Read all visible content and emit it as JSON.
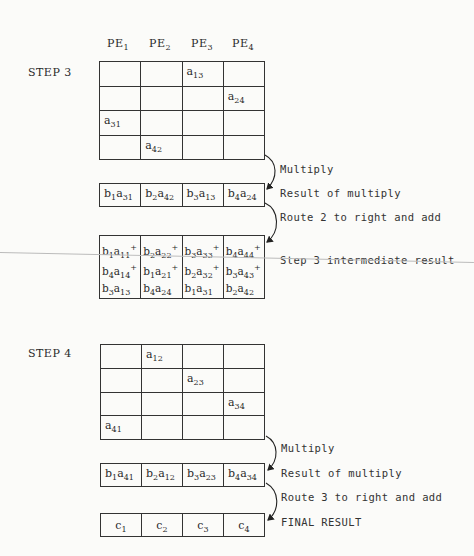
{
  "header": {
    "pe": [
      {
        "base": "PE",
        "sub": "1"
      },
      {
        "base": "PE",
        "sub": "2"
      },
      {
        "base": "PE",
        "sub": "3"
      },
      {
        "base": "PE",
        "sub": "4"
      }
    ]
  },
  "step3": {
    "label": "STEP 3",
    "matrix": [
      [
        null,
        null,
        {
          "base": "a",
          "sub": "13"
        },
        null
      ],
      [
        null,
        null,
        null,
        {
          "base": "a",
          "sub": "24"
        }
      ],
      [
        {
          "base": "a",
          "sub": "31"
        },
        null,
        null,
        null
      ],
      [
        null,
        {
          "base": "a",
          "sub": "42"
        },
        null,
        null
      ]
    ],
    "multiply_label": "Multiply",
    "result_label": "Result of multiply",
    "result": [
      [
        {
          "b": "1",
          "a": "31"
        }
      ],
      [
        {
          "b": "2",
          "a": "42"
        }
      ],
      [
        {
          "b": "3",
          "a": "13"
        }
      ],
      [
        {
          "b": "4",
          "a": "24"
        }
      ]
    ],
    "route_label": "Route 2 to right and add",
    "intermediate_label": "Step 3 intermediate result",
    "intermediate": [
      [
        {
          "b": "1",
          "a": "11",
          "plus": true
        },
        {
          "b": "4",
          "a": "14",
          "plus": true
        },
        {
          "b": "3",
          "a": "13",
          "plus": false
        }
      ],
      [
        {
          "b": "2",
          "a": "22",
          "plus": true
        },
        {
          "b": "1",
          "a": "21",
          "plus": true
        },
        {
          "b": "4",
          "a": "24",
          "plus": false
        }
      ],
      [
        {
          "b": "3",
          "a": "33",
          "plus": true
        },
        {
          "b": "2",
          "a": "32",
          "plus": true
        },
        {
          "b": "1",
          "a": "31",
          "plus": false
        }
      ],
      [
        {
          "b": "4",
          "a": "44",
          "plus": true
        },
        {
          "b": "3",
          "a": "43",
          "plus": true
        },
        {
          "b": "2",
          "a": "42",
          "plus": false
        }
      ]
    ]
  },
  "step4": {
    "label": "STEP 4",
    "matrix": [
      [
        null,
        {
          "base": "a",
          "sub": "12"
        },
        null,
        null
      ],
      [
        null,
        null,
        {
          "base": "a",
          "sub": "23"
        },
        null
      ],
      [
        null,
        null,
        null,
        {
          "base": "a",
          "sub": "34"
        }
      ],
      [
        {
          "base": "a",
          "sub": "41"
        },
        null,
        null,
        null
      ]
    ],
    "multiply_label": "Multiply",
    "result_label": "Result of multiply",
    "result": [
      [
        {
          "b": "1",
          "a": "41"
        }
      ],
      [
        {
          "b": "2",
          "a": "12"
        }
      ],
      [
        {
          "b": "3",
          "a": "23"
        }
      ],
      [
        {
          "b": "4",
          "a": "34"
        }
      ]
    ],
    "route_label": "Route 3 to right and add",
    "final_label": "FINAL RESULT",
    "final": [
      {
        "base": "c",
        "sub": "1"
      },
      {
        "base": "c",
        "sub": "2"
      },
      {
        "base": "c",
        "sub": "3"
      },
      {
        "base": "c",
        "sub": "4"
      }
    ]
  },
  "colors": {
    "line": "#333333",
    "background": "#fbfbf9",
    "artifact": "#bbbbbb"
  }
}
